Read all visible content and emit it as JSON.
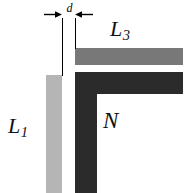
{
  "figure": {
    "background_color": "#ffffff"
  },
  "shapes": {
    "l1_bar": {
      "name": "L1",
      "color": "#b5b5b5",
      "orientation": "vertical",
      "description": "light gray vertical bar on the left"
    },
    "l3_bar": {
      "name": "L3",
      "color": "#787878",
      "orientation": "horizontal",
      "description": "medium gray horizontal bar at the top"
    },
    "n_region": {
      "name": "N",
      "color": "#2b2b2b",
      "orientation": "L-shaped",
      "description": "dark L-shaped corner region"
    }
  },
  "labels": {
    "l1": {
      "base": "L",
      "sub": "1"
    },
    "l3": {
      "base": "L",
      "sub": "3"
    },
    "n": {
      "base": "N",
      "sub": ""
    }
  },
  "dimension": {
    "symbol": "d",
    "arrow_direction": "inward",
    "description": "gap width dimension between L1 bar and N region"
  }
}
